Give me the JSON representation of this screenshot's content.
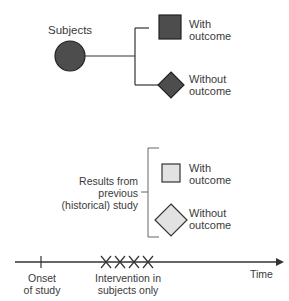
{
  "subjects": {
    "label": "Subjects",
    "with_outcome": [
      "With",
      "outcome"
    ],
    "without_outcome": [
      "Without",
      "outcome"
    ]
  },
  "historical": {
    "label": [
      "Results from",
      "previous",
      "(historical) study"
    ],
    "with_outcome": [
      "With",
      "outcome"
    ],
    "without_outcome": [
      "Without",
      "outcome"
    ]
  },
  "timeline": {
    "onset_label": [
      "Onset",
      "of study"
    ],
    "intervention_label": [
      "Intervention in",
      "subjects only"
    ],
    "time_label": "Time",
    "intervention_marks": 4
  },
  "colors": {
    "subject_fill": "#4d4d4d",
    "historical_fill": "#e2e2e2",
    "line": "#333333",
    "bracket": "#666666"
  }
}
